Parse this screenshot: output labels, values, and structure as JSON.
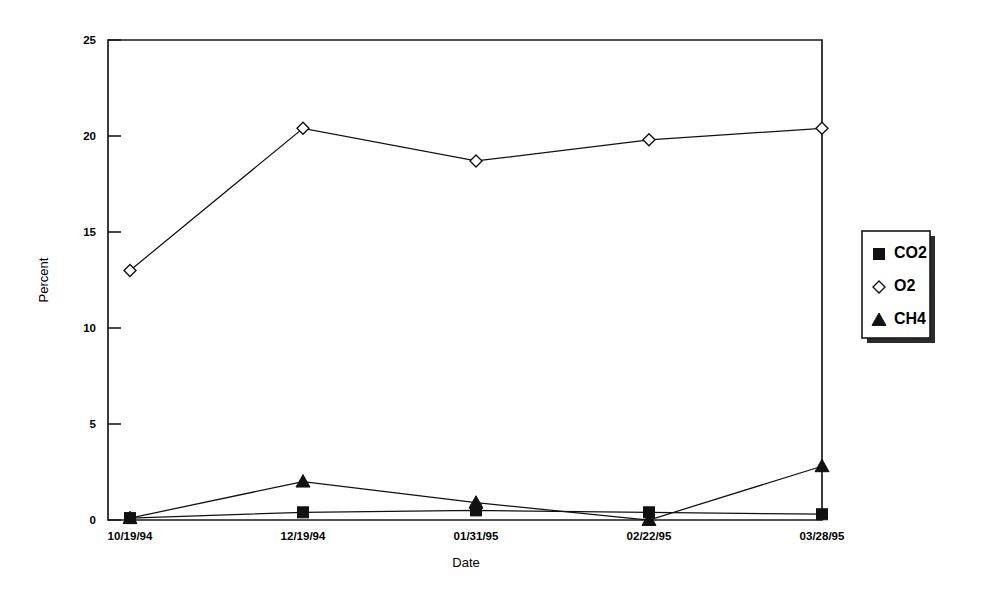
{
  "chart_data": {
    "type": "line",
    "title": "",
    "subtitle": "",
    "xlabel": "Date",
    "ylabel": "Percent",
    "categories": [
      "10/19/94",
      "12/19/94",
      "01/31/95",
      "02/22/95",
      "03/28/95"
    ],
    "ylim": [
      0,
      25
    ],
    "yticks": [
      0,
      5,
      10,
      15,
      20,
      25
    ],
    "ytick_labels": [
      "0",
      "5",
      "10",
      "15",
      "20",
      "25"
    ],
    "grid": false,
    "legend_position": "right",
    "series": [
      {
        "name": "CO2",
        "marker": "filled-square",
        "color": "#111111",
        "values": [
          0.1,
          0.4,
          0.5,
          0.4,
          0.3
        ]
      },
      {
        "name": "O2",
        "marker": "open-diamond",
        "color": "#111111",
        "values": [
          13.0,
          20.4,
          18.7,
          19.8,
          20.4
        ]
      },
      {
        "name": "CH4",
        "marker": "filled-triangle",
        "color": "#111111",
        "values": [
          0.1,
          2.0,
          0.9,
          0.0,
          2.8
        ]
      }
    ]
  },
  "legend": {
    "entries": [
      "CO2",
      "O2",
      "CH4"
    ]
  },
  "axes": {
    "y_title": "Percent",
    "x_title": "Date"
  }
}
